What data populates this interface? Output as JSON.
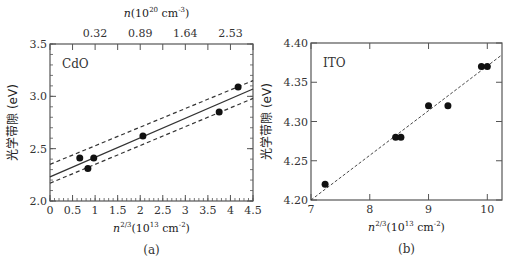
{
  "chart_data": [
    {
      "type": "scatter",
      "panel": "(a)",
      "annotation": "CdO",
      "xlabel": "n^{2/3}(10^13 cm^-2)",
      "xlabel_parts": {
        "base": "n",
        "sup": "2/3",
        "unit_pre": "(10",
        "unit_sup": "13",
        "unit_mid": " cm",
        "unit_sup2": "-2",
        "unit_post": ")"
      },
      "ylabel": "光学带隙 (eV)",
      "top_xlabel": "n(10^20 cm^-3)",
      "top_xlabel_parts": {
        "base": "n(10",
        "sup": "20",
        "mid": " cm",
        "sup2": "-3",
        "post": ")"
      },
      "xlim": [
        0,
        4.5
      ],
      "ylim": [
        2.0,
        3.5
      ],
      "xticks": [
        0,
        0.5,
        1,
        1.5,
        2,
        2.5,
        3,
        3.5,
        4,
        4.5
      ],
      "xtick_labels": [
        "0",
        "0.5",
        "1",
        "1.5",
        "2",
        "2.5",
        "3",
        "3.5",
        "4",
        "4.5"
      ],
      "yticks": [
        2.0,
        2.5,
        3.0,
        3.5
      ],
      "ytick_labels": [
        "2.0",
        "2.5",
        "3.0",
        "3.5"
      ],
      "top_xticks": [
        1,
        2,
        3,
        4
      ],
      "top_xtick_labels": [
        "0.32",
        "0.89",
        "1.64",
        "2.53"
      ],
      "points": [
        {
          "x": 0.66,
          "y": 2.41
        },
        {
          "x": 0.84,
          "y": 2.31
        },
        {
          "x": 0.97,
          "y": 2.41
        },
        {
          "x": 2.06,
          "y": 2.62
        },
        {
          "x": 3.75,
          "y": 2.85
        },
        {
          "x": 4.17,
          "y": 3.09
        }
      ],
      "lines": [
        {
          "name": "fit",
          "style": "solid",
          "x": [
            0,
            4.5
          ],
          "y": [
            2.23,
            3.07
          ]
        },
        {
          "name": "upper bound",
          "style": "dashed",
          "x": [
            0,
            4.5
          ],
          "y": [
            2.35,
            3.15
          ]
        },
        {
          "name": "lower bound",
          "style": "dashed",
          "x": [
            0,
            4.5
          ],
          "y": [
            2.17,
            2.98
          ]
        }
      ],
      "grid": false
    },
    {
      "type": "scatter",
      "panel": "(b)",
      "annotation": "ITO",
      "xlabel": "n^{2/3}(10^13 cm^-2)",
      "xlabel_parts": {
        "base": "n",
        "sup": "2/3",
        "unit_pre": "(10",
        "unit_sup": "13",
        "unit_mid": " cm",
        "unit_sup2": "-2",
        "unit_post": ")"
      },
      "ylabel": "光学带隙 (eV)",
      "xlim": [
        7,
        10.25
      ],
      "ylim": [
        4.2,
        4.4
      ],
      "xticks": [
        7,
        8,
        9,
        10
      ],
      "xtick_labels": [
        "7",
        "8",
        "9",
        "10"
      ],
      "yticks": [
        4.2,
        4.25,
        4.3,
        4.35,
        4.4
      ],
      "ytick_labels": [
        "4.20",
        "4.25",
        "4.30",
        "4.35",
        "4.40"
      ],
      "points": [
        {
          "x": 7.24,
          "y": 4.22
        },
        {
          "x": 8.44,
          "y": 4.28
        },
        {
          "x": 8.53,
          "y": 4.28
        },
        {
          "x": 9.0,
          "y": 4.32
        },
        {
          "x": 9.33,
          "y": 4.32
        },
        {
          "x": 9.9,
          "y": 4.37
        },
        {
          "x": 10.0,
          "y": 4.37
        }
      ],
      "lines": [
        {
          "name": "fit",
          "style": "dashed",
          "x": [
            7.0,
            10.25
          ],
          "y": [
            4.2,
            4.385
          ]
        }
      ],
      "grid": false
    }
  ],
  "colors": {
    "frame": "#555555",
    "points": "#111111",
    "lines": "#333333",
    "text": "#333333"
  }
}
